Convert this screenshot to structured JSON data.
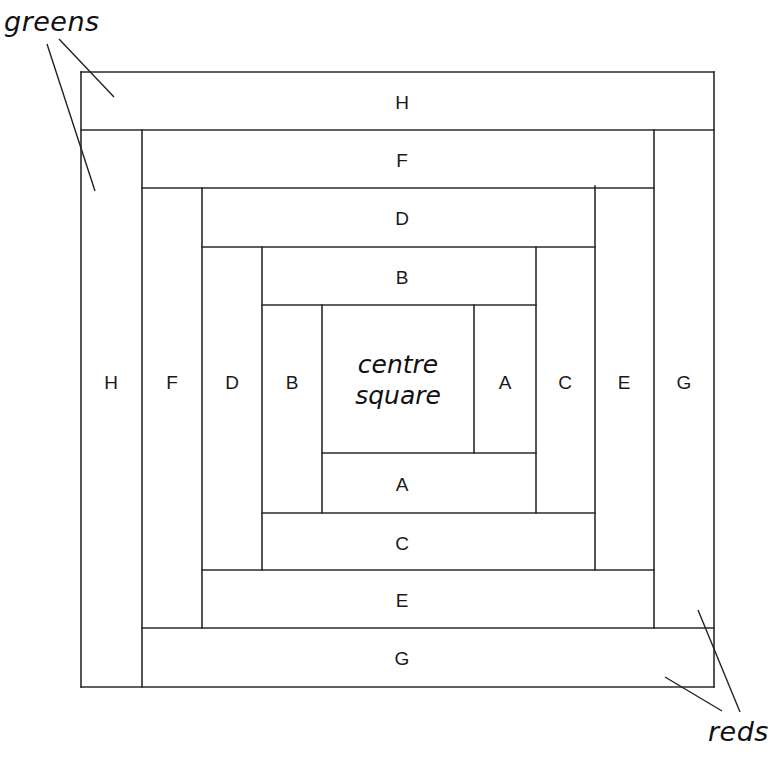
{
  "diagram": {
    "type": "log-cabin-quilt-block",
    "annotations": {
      "greens": "greens",
      "reds": "reds"
    },
    "centre": {
      "line1": "centre",
      "line2": "square"
    },
    "strips": {
      "top": [
        "B",
        "D",
        "F",
        "H"
      ],
      "bottom": [
        "A",
        "C",
        "E",
        "G"
      ],
      "left": [
        "B",
        "D",
        "F",
        "H"
      ],
      "right": [
        "A",
        "C",
        "E",
        "G"
      ]
    },
    "colors": {
      "line": "#2a2a2a",
      "background": "#ffffff"
    }
  }
}
